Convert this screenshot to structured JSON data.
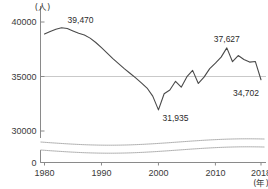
{
  "chart_data": {
    "type": "line",
    "title": "",
    "xlabel": "年",
    "ylabel": "人",
    "y_unit_label": "(人)",
    "x_unit_label": "(年)",
    "xlim": [
      1980,
      2018
    ],
    "ylim": [
      30000,
      40000
    ],
    "yticks": [
      "0",
      "30000",
      "35000",
      "40000"
    ],
    "ytick_values": [
      0,
      30000,
      35000,
      40000
    ],
    "xticks": [
      "1980",
      "1990",
      "2000",
      "2010",
      "2018"
    ],
    "xtick_values": [
      1980,
      1990,
      2000,
      2010,
      2018
    ],
    "grid": "horizontal-35000-only",
    "legend": "none",
    "axis_break": true,
    "axis_break_note": "wavy break between 0 and 30000",
    "annotations": [
      {
        "label": "39,470",
        "x": 1983,
        "y": 39470
      },
      {
        "label": "31,935",
        "x": 2000,
        "y": 31935
      },
      {
        "label": "37,627",
        "x": 2012,
        "y": 37627
      },
      {
        "label": "34,702",
        "x": 2018,
        "y": 34702
      }
    ],
    "x": [
      1980,
      1981,
      1982,
      1983,
      1984,
      1985,
      1986,
      1987,
      1988,
      1989,
      1990,
      1991,
      1992,
      1993,
      1994,
      1995,
      1996,
      1997,
      1998,
      1999,
      2000,
      2001,
      2002,
      2003,
      2004,
      2005,
      2006,
      2007,
      2008,
      2009,
      2010,
      2011,
      2012,
      2013,
      2014,
      2015,
      2016,
      2017,
      2018
    ],
    "values": [
      38900,
      39130,
      39330,
      39470,
      39400,
      39180,
      38960,
      38800,
      38520,
      38120,
      37640,
      37150,
      36640,
      36180,
      35720,
      35300,
      34880,
      34420,
      33940,
      33200,
      31935,
      33420,
      33760,
      34560,
      34020,
      34980,
      35560,
      34360,
      34940,
      35720,
      36220,
      36780,
      37627,
      36360,
      36920,
      36560,
      36320,
      36380,
      34702
    ],
    "series": [
      {
        "name": "人数",
        "values": [
          38900,
          39130,
          39330,
          39470,
          39400,
          39180,
          38960,
          38800,
          38520,
          38120,
          37640,
          37150,
          36640,
          36180,
          35720,
          35300,
          34880,
          34420,
          33940,
          33200,
          31935,
          33420,
          33760,
          34560,
          34020,
          34980,
          35560,
          34360,
          34940,
          35720,
          36220,
          36780,
          37627,
          36360,
          36920,
          36560,
          36320,
          36380,
          34702
        ]
      }
    ],
    "colors": {
      "line": "#4a4a4a",
      "grid": "#c9c9c9",
      "axis": "#8a8a8a",
      "text": "#2b2b2b",
      "background": "#ffffff"
    }
  }
}
